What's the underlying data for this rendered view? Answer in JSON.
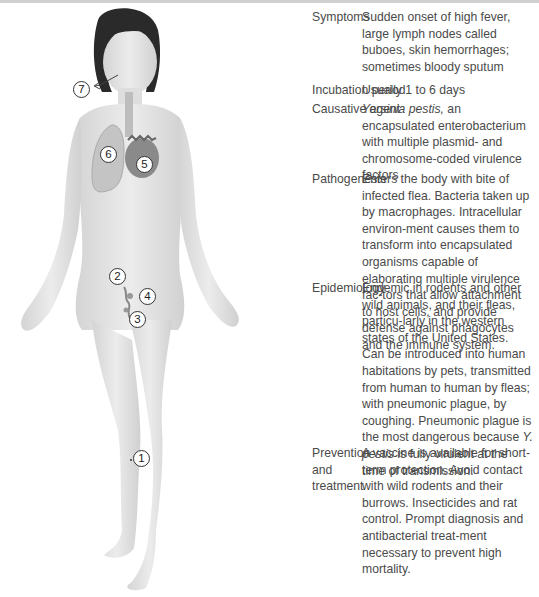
{
  "figure": {
    "markers": [
      {
        "id": "1",
        "label": "1",
        "site": "flea-bite-lower-leg"
      },
      {
        "id": "2",
        "label": "2",
        "site": "lymphatic-vessel"
      },
      {
        "id": "3",
        "label": "3",
        "site": "inguinal-lymph-node"
      },
      {
        "id": "4",
        "label": "4",
        "site": "lymph-node-bubo"
      },
      {
        "id": "5",
        "label": "5",
        "site": "heart-bloodstream"
      },
      {
        "id": "6",
        "label": "6",
        "site": "lung"
      },
      {
        "id": "7",
        "label": "7",
        "site": "mouth-cough-exhalation"
      }
    ]
  },
  "table": {
    "rows": [
      {
        "label": "Symptoms",
        "value": "Sudden onset of high fever, large lymph nodes called buboes, skin hemorrhages; sometimes bloody sputum"
      },
      {
        "label": "Incubation period",
        "value": "Usually 1 to 6 days"
      },
      {
        "label": "Causative agent",
        "value_italic": "Yersinia pestis,",
        "value": " an encapsulated enterobacterium with multiple plasmid- and chromosome-coded virulence factors"
      },
      {
        "label": "Pathogenesis",
        "value": "Enters the body with bite of infected flea. Bacteria taken up by macrophages. Intracellular environ-ment causes them to transform into encapsulated organisms capable of elaborating multiple virulence fac-tors that allow attachment to host cells, and provide defense against phagocytes and the immune system."
      },
      {
        "label": "Epidemiology",
        "value": "Endemic in rodents and other wild animals, and their fleas, particu-larly in the western states of the United States. Can be introduced into human habitations by pets, transmitted from human to human by fleas; with pneumonic plague, by coughing. Pneumonic plague is the most dangerous because",
        "value_italic_2": "Y. pestis",
        "value_2": " is fully virulent at the time of transmission."
      },
      {
        "label": "Prevention and treatment",
        "value": "A vaccine is available for short-term protection. Avoid contact with wild rodents and their burrows. Insecticides and rat control. Prompt diagnosis and antibacterial treat-ment necessary to prevent high mortality."
      }
    ]
  }
}
